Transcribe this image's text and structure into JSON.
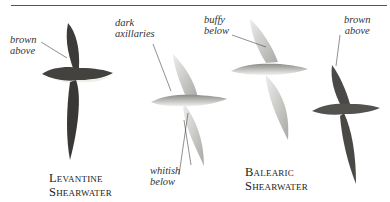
{
  "figure": {
    "annotations": {
      "levantine_brown_above": [
        "brown",
        "above"
      ],
      "dark_axillaries": [
        "dark",
        "axillaries"
      ],
      "whitish_below": [
        "whitish",
        "below"
      ],
      "buffy_below": [
        "buffy",
        "below"
      ],
      "balearic_brown_above": [
        "brown",
        "above"
      ]
    },
    "species": [
      {
        "line1": "Levantine",
        "line2": "Shearwater"
      },
      {
        "line1": "Balearic",
        "line2": "Shearwater"
      }
    ],
    "colors": {
      "dark_bird": "#3d3b39",
      "pale_bird": "#c9c9c6",
      "rule": "#555555"
    }
  }
}
